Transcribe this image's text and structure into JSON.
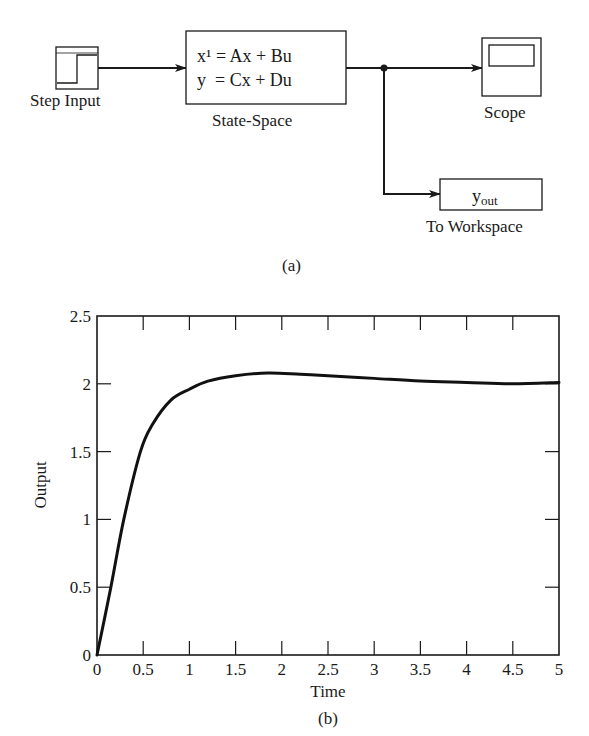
{
  "diagram": {
    "caption": "(a)",
    "blocks": {
      "step": {
        "label": "Step Input",
        "icon": "step-signal-icon"
      },
      "state_space": {
        "label": "State-Space",
        "eq1": "x¹ = Ax + Bu",
        "eq2": "y  = Cx + Du"
      },
      "scope": {
        "label": "Scope",
        "icon": "scope-screen-icon"
      },
      "workspace": {
        "label": "To Workspace",
        "var_main": "y",
        "var_sub": "out"
      }
    },
    "connections": [
      "Step Input -> State-Space",
      "State-Space -> Scope",
      "State-Space -> To Workspace"
    ]
  },
  "plot": {
    "caption": "(b)",
    "xlabel": "Time",
    "ylabel": "Output",
    "xticks": [
      "0",
      "0.5",
      "1",
      "1.5",
      "2",
      "2.5",
      "3",
      "3.5",
      "4",
      "4.5",
      "5"
    ],
    "yticks": [
      "0",
      "0.5",
      "1",
      "1.5",
      "2",
      "2.5"
    ]
  },
  "chart_data": {
    "type": "line",
    "title": "",
    "xlabel": "Time",
    "ylabel": "Output",
    "xlim": [
      0,
      5
    ],
    "ylim": [
      0,
      2.5
    ],
    "grid": false,
    "legend": null,
    "series": [
      {
        "name": "Output",
        "x": [
          0,
          0.15,
          0.29,
          0.47,
          0.6,
          0.8,
          1.0,
          1.2,
          1.5,
          1.85,
          2.2,
          2.5,
          3.0,
          3.5,
          4.0,
          4.5,
          5.0
        ],
        "y": [
          0,
          0.5,
          1.0,
          1.5,
          1.7,
          1.88,
          1.96,
          2.02,
          2.06,
          2.08,
          2.07,
          2.06,
          2.04,
          2.02,
          2.01,
          2.0,
          2.01
        ]
      }
    ]
  }
}
